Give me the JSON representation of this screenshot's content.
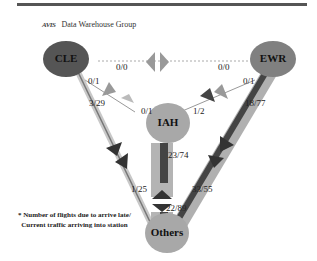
{
  "header": {
    "logo": "AVIS",
    "title": "Data Warehouse Group"
  },
  "colors": {
    "node_dark": "#555555",
    "node_mid": "#808080",
    "node_light": "#a8a8a8",
    "bar_dark": "#4a4a4a",
    "bar_light": "#b4b4b4"
  },
  "nodes": [
    {
      "id": "CLE",
      "label": "CLE"
    },
    {
      "id": "EWR",
      "label": "EWR"
    },
    {
      "id": "IAH",
      "label": "IAH"
    },
    {
      "id": "Others",
      "label": "Others"
    }
  ],
  "edges": {
    "cle_ewr": "0/0",
    "ewr_cle": "0/0",
    "cle_iah": "0/1",
    "iah_cle": "0/1",
    "ewr_iah": "0/1",
    "iah_ewr": "1/2",
    "cle_others": "3/29",
    "ewr_others": "18/77",
    "iah_others": "23/74",
    "others_cle": "1/25",
    "others_ewr": "33/55",
    "others_iah": "22/89"
  },
  "note": {
    "line1": "* Number of flights due to arrive late/",
    "line2": "Current traffic arriving into station"
  }
}
